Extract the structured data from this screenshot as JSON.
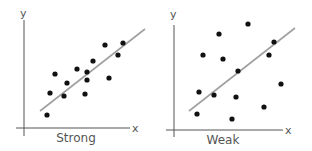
{
  "chart_data": [
    {
      "type": "scatter",
      "title": "Strong",
      "xlabel": "x",
      "ylabel": "y",
      "grid": false,
      "trendline": true,
      "points_px": [
        [
          47,
          115
        ],
        [
          50,
          93
        ],
        [
          55,
          74
        ],
        [
          64,
          96
        ],
        [
          67,
          83
        ],
        [
          77,
          69
        ],
        [
          85,
          94
        ],
        [
          87,
          80
        ],
        [
          87,
          72
        ],
        [
          93,
          61
        ],
        [
          109,
          78
        ],
        [
          105,
          45
        ],
        [
          118,
          55
        ],
        [
          123,
          43
        ]
      ],
      "trend_px": [
        [
          40,
          111
        ],
        [
          145,
          29
        ]
      ]
    },
    {
      "type": "scatter",
      "title": "Weak",
      "xlabel": "x",
      "ylabel": "y",
      "grid": false,
      "trendline": true,
      "points_px": [
        [
          203,
          55
        ],
        [
          219,
          34
        ],
        [
          248,
          24
        ],
        [
          223,
          59
        ],
        [
          238,
          71
        ],
        [
          274,
          42
        ],
        [
          269,
          55
        ],
        [
          281,
          84
        ],
        [
          264,
          107
        ],
        [
          199,
          92
        ],
        [
          214,
          95
        ],
        [
          236,
          97
        ],
        [
          197,
          114
        ],
        [
          232,
          119
        ]
      ],
      "trend_px": [
        [
          189,
          111
        ],
        [
          295,
          28
        ]
      ]
    }
  ],
  "plots": {
    "strong": {
      "caption": "Strong",
      "x_label": "x",
      "y_label": "y"
    },
    "weak": {
      "caption": "Weak",
      "x_label": "x",
      "y_label": "y"
    }
  },
  "colors": {
    "axis": "#555555",
    "trend": "#a0a0a0",
    "dot": "#111111"
  }
}
